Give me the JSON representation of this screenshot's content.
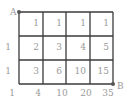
{
  "diagram": {
    "title": "",
    "grid": {
      "columns": 4,
      "rows": 3
    },
    "corners": {
      "start": "A",
      "end": "B"
    },
    "cell_values": [
      [
        "1",
        "1",
        "1",
        "1"
      ],
      [
        "2",
        "3",
        "4",
        "5"
      ],
      [
        "3",
        "6",
        "10",
        "15"
      ]
    ],
    "left_edge_values": [
      "1",
      "1"
    ],
    "bottom_edge_values": [
      "1",
      "4",
      "10",
      "20",
      "35"
    ],
    "colors": {
      "line": "#3a3a3a",
      "text": "#9a9a9a",
      "dot": "#555555"
    }
  }
}
